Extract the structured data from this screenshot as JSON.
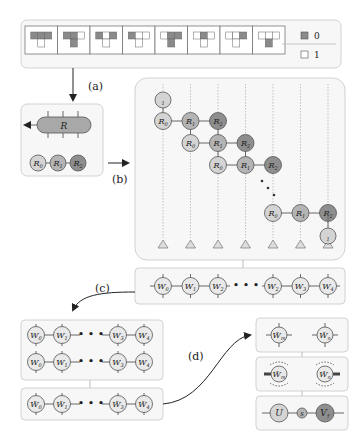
{
  "legend": {
    "dark": {
      "label": "0",
      "color": "#8a8a8a"
    },
    "light": {
      "label": "1",
      "color": "#ffffff"
    }
  },
  "tiles": [
    {
      "top": [
        0,
        0,
        0
      ],
      "bottom": 1
    },
    {
      "top": [
        0,
        0,
        1
      ],
      "bottom": 0
    },
    {
      "top": [
        0,
        1,
        0
      ],
      "bottom": 1
    },
    {
      "top": [
        0,
        1,
        1
      ],
      "bottom": 1
    },
    {
      "top": [
        1,
        0,
        0
      ],
      "bottom": 0
    },
    {
      "top": [
        1,
        0,
        1
      ],
      "bottom": 1
    },
    {
      "top": [
        1,
        1,
        0
      ],
      "bottom": 1
    },
    {
      "top": [
        1,
        1,
        1
      ],
      "bottom": 0
    }
  ],
  "steps": {
    "a": "(a)",
    "b": "(b)",
    "c": "(c)",
    "d": "(d)"
  },
  "panel_a": {
    "big_tensor": "R",
    "chain": [
      "R0",
      "R1",
      "R2"
    ]
  },
  "panel_b": {
    "start_label": "1",
    "end_label": "1",
    "rows": [
      [
        "R0",
        "R1",
        "R2"
      ],
      [
        "R0",
        "R1",
        "R2"
      ],
      [
        "R0",
        "R1",
        "R2"
      ],
      [
        "R0",
        "R1",
        "R2"
      ]
    ]
  },
  "mpo_row": {
    "nodes": [
      "W0",
      "W1",
      "W2",
      "W2",
      "W3",
      "W4"
    ],
    "ellipsis": "• • •"
  },
  "panel_c": {
    "row1": [
      "W0",
      "W1",
      "W3",
      "W4"
    ],
    "row2": [
      "W0",
      "W1",
      "W3",
      "W4"
    ],
    "row3": [
      "W̃0",
      "W̃1",
      "W̃3",
      "W̃4"
    ]
  },
  "panel_d": {
    "pair": [
      "W̃m",
      "W̃n"
    ],
    "svd": [
      "U",
      "s",
      "V†"
    ]
  },
  "colors": {
    "light_node": "#d4d4d4",
    "mid_node": "#b4b4b4",
    "dark_node": "#8e8e8e",
    "w_node": "#e9e9e9"
  }
}
